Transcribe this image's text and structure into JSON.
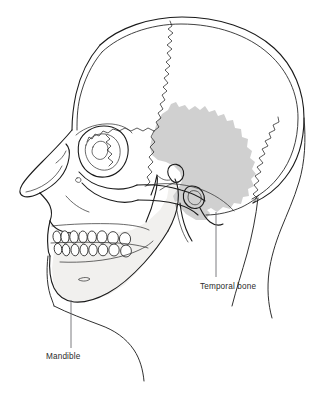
{
  "figure": {
    "background_color": "#ffffff",
    "width": 328,
    "height": 393
  },
  "labels": [
    {
      "id": "temporal-bone",
      "text": "Temporal bone",
      "text_x": 200,
      "text_y": 289,
      "leader_x": 216,
      "leader_y_start": 212,
      "leader_y_end": 277,
      "highlight_color": "#d0d0d0"
    },
    {
      "id": "mandible",
      "text": "Mandible",
      "text_x": 46,
      "text_y": 359,
      "leader_x": 71,
      "leader_y_start": 300,
      "leader_y_end": 348,
      "highlight_color": "#f1f0ee"
    }
  ],
  "structures": {
    "temporal_bone": {
      "name": "Temporal bone",
      "fill": "#d0d0d0",
      "stroke": "#1a1a1a",
      "shaded": "true"
    },
    "mandible": {
      "name": "Mandible",
      "fill": "#f1f0ee",
      "stroke": "#1a1a1a",
      "shaded": "true"
    },
    "cranial_vault": {
      "name": "Cranial vault",
      "fill": "#ffffff",
      "stroke": "#1a1a1a"
    },
    "maxilla": {
      "name": "Maxilla",
      "fill": "#ffffff",
      "stroke": "#1a1a1a"
    },
    "orbit": {
      "name": "Orbit",
      "fill": "#ffffff",
      "stroke": "#1a1a1a"
    },
    "zygomatic_arch": {
      "name": "Zygomatic arch",
      "fill": "#ffffff",
      "stroke": "#1a1a1a"
    },
    "coronal_suture": {
      "name": "Coronal suture",
      "stroke": "#262626"
    },
    "lambdoid_suture": {
      "name": "Lambdoid suture",
      "stroke": "#262626"
    },
    "teeth_upper": {
      "name": "Upper dental arch",
      "count": 8
    },
    "teeth_lower": {
      "name": "Lower dental arch",
      "count": 8
    }
  },
  "line_colors": {
    "outline": "#1a1a1a",
    "detail": "#2a2a2a",
    "soft_tissue": "#303030",
    "leader": "#6e6e73",
    "label_text": "#2b2b2b"
  }
}
